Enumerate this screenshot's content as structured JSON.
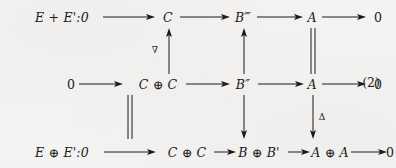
{
  "figure": {
    "kind": "commutative-diagram",
    "equation_number": "(2)",
    "background_color": "#f4f3f1",
    "ink_color": "#1c1a18"
  },
  "rows": {
    "top": {
      "nodes": [
        {
          "id": "r1c0",
          "text": "E + E':0"
        },
        {
          "id": "r1c1",
          "text": "C"
        },
        {
          "id": "r1c2",
          "text": "B‴"
        },
        {
          "id": "r1c3",
          "text": "A"
        },
        {
          "id": "r1c4",
          "text": "0"
        }
      ]
    },
    "middle": {
      "nodes": [
        {
          "id": "r2c0",
          "text": "0"
        },
        {
          "id": "r2c1",
          "text": "C ⊕ C"
        },
        {
          "id": "r2c2",
          "text": "B″"
        },
        {
          "id": "r2c3",
          "text": "A"
        },
        {
          "id": "r2c4",
          "text": "0"
        }
      ]
    },
    "bottom": {
      "nodes": [
        {
          "id": "r3c0",
          "text": "E ⊕ E':0"
        },
        {
          "id": "r3c1",
          "text": "C ⊕ C"
        },
        {
          "id": "r3c2",
          "text": "B ⊕ B'"
        },
        {
          "id": "r3c3",
          "text": "A ⊕ A"
        },
        {
          "id": "r3c4",
          "text": "0"
        }
      ]
    }
  },
  "vertical_morphisms": {
    "nabla_label": "∇",
    "delta_label": "Δ",
    "col1_top": {
      "type": "arrow-up",
      "label": "∇"
    },
    "col2_top": {
      "type": "arrow-up",
      "label": ""
    },
    "col3_top": {
      "type": "double-line",
      "label": ""
    },
    "col1_bottom": {
      "type": "double-line",
      "label": ""
    },
    "col2_bottom": {
      "type": "arrow-down",
      "label": ""
    },
    "col3_bottom": {
      "type": "arrow-down",
      "label": "Δ"
    }
  },
  "arrow_glyphs": {
    "long_right": "⟶",
    "short_right": "→",
    "up": "↑",
    "down": "↓",
    "double_bar": "‖"
  }
}
